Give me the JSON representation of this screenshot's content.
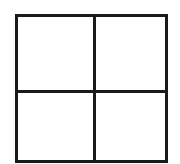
{
  "diagram": {
    "type": "grid",
    "rows": 2,
    "columns": 2,
    "line_color": "#1a1a1a",
    "background_color": "#ffffff",
    "cells": [
      {
        "position": "top-left",
        "label": ""
      },
      {
        "position": "top-right",
        "label": ""
      },
      {
        "position": "bottom-left",
        "label": ""
      },
      {
        "position": "bottom-right",
        "label": ""
      }
    ]
  }
}
